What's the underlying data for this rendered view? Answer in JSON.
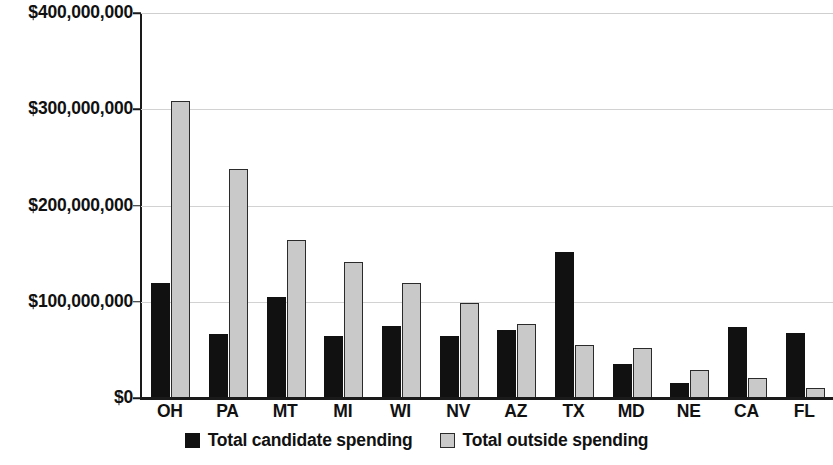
{
  "chart_data": {
    "type": "bar",
    "title": "",
    "subtitle": "",
    "xlabel": "",
    "ylabel": "",
    "categories": [
      "OH",
      "PA",
      "MT",
      "MI",
      "WI",
      "NV",
      "AZ",
      "TX",
      "MD",
      "NE",
      "CA",
      "FL"
    ],
    "series": [
      {
        "name": "Total candidate spending",
        "color": "#111111",
        "values": [
          120000000,
          67000000,
          105000000,
          64000000,
          75000000,
          64000000,
          71000000,
          152000000,
          35000000,
          16000000,
          74000000,
          68000000
        ]
      },
      {
        "name": "Total outside spending",
        "color": "#c9c9c9",
        "values": [
          309000000,
          238000000,
          164000000,
          141000000,
          120000000,
          99000000,
          77000000,
          55000000,
          52000000,
          29000000,
          21000000,
          10000000
        ]
      }
    ],
    "ylim": [
      0,
      400000000
    ],
    "ytick_values": [
      0,
      100000000,
      200000000,
      300000000,
      400000000
    ],
    "ytick_labels": [
      "$0",
      "$100,000,000",
      "$200,000,000",
      "$300,000,000",
      "$400,000,000"
    ],
    "grid": true,
    "grid_axis": "y",
    "legend_position": "bottom",
    "legend": [
      "Total candidate spending",
      "Total outside spending"
    ]
  },
  "axis": {
    "y_labels": [
      "$400,000,000",
      "$300,000,000",
      "$200,000,000",
      "$100,000,000",
      "$0"
    ],
    "x_labels": [
      "OH",
      "PA",
      "MT",
      "MI",
      "WI",
      "NV",
      "AZ",
      "TX",
      "MD",
      "NE",
      "CA",
      "FL"
    ]
  },
  "legend": {
    "candidate_label": "Total candidate spending",
    "outside_label": "Total outside spending"
  },
  "colors": {
    "candidate": "#111111",
    "outside": "#c9c9c9",
    "outside_border": "#2b2b2b",
    "gridline": "#d2d2d2",
    "axis": "#1a1a1a",
    "background": "#ffffff",
    "text": "#111111"
  }
}
